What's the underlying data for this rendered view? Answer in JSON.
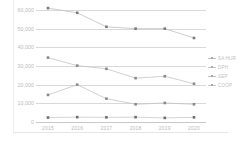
{
  "chart_data": {
    "type": "line",
    "title": "",
    "xlabel": "",
    "ylabel": "",
    "x": [
      "2015",
      "2016",
      "2017",
      "2018",
      "2019",
      "2020"
    ],
    "ylim": [
      0,
      60000
    ],
    "yticks": [
      0,
      10000,
      20000,
      30000,
      40000,
      50000,
      60000
    ],
    "ytick_labels": [
      "0",
      "10,000",
      "20,000",
      "30,000",
      "40,000",
      "50,000",
      "60,000"
    ],
    "grid": true,
    "legend_position": "right",
    "series": [
      {
        "name": "SA HUR",
        "color": "#bfbfbf",
        "marker_color": "#7a7a7a",
        "values": [
          61000,
          58500,
          51000,
          50000,
          50000,
          45000
        ]
      },
      {
        "name": "DPH",
        "color": "#c4c4c4",
        "marker_color": "#8a8a8a",
        "values": [
          34500,
          30200,
          28500,
          23500,
          24500,
          20500
        ]
      },
      {
        "name": "SEP",
        "color": "#c4c4c4",
        "marker_color": "#8a8a8a",
        "values": [
          14500,
          20000,
          12500,
          9500,
          10200,
          9500
        ]
      },
      {
        "name": "COOP",
        "color": "#c9c9c9",
        "marker_color": "#6e6e6e",
        "values": [
          2400,
          2600,
          2500,
          2600,
          2200,
          2500
        ]
      }
    ]
  }
}
